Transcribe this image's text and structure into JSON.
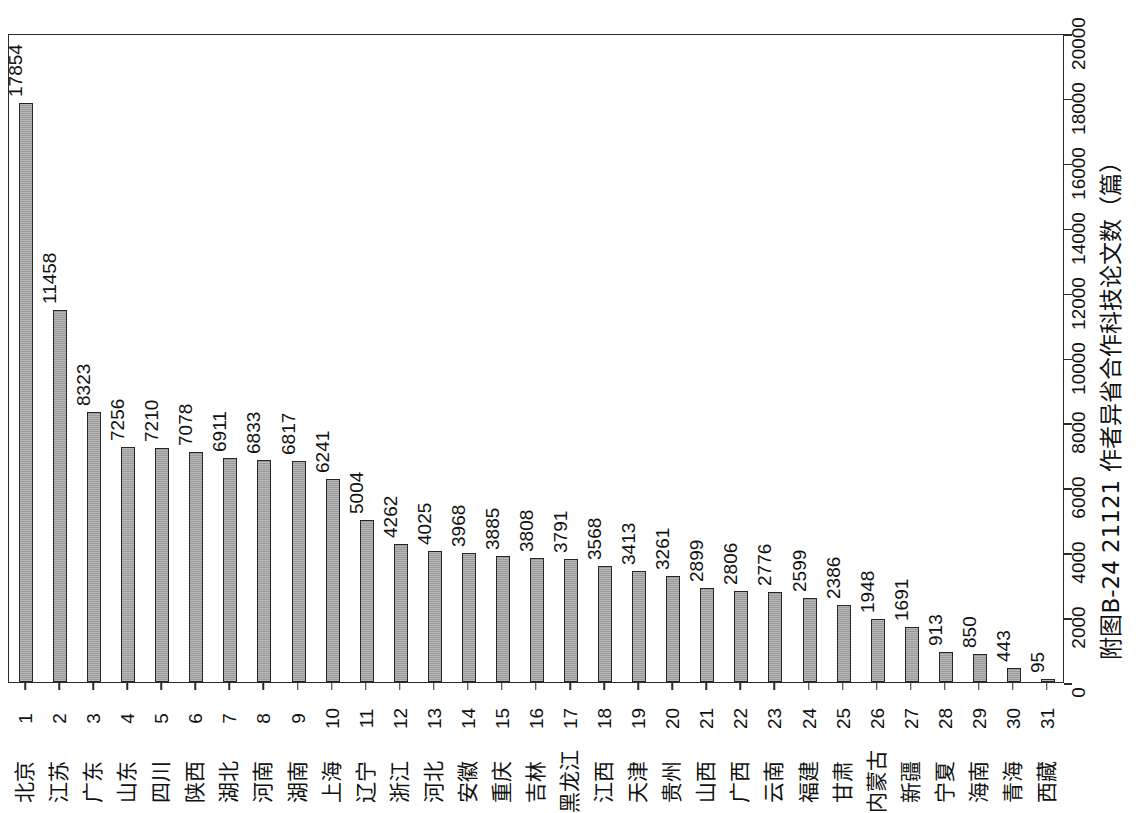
{
  "caption": "附图B-24  21121 作者异省合作科技论文数（篇）",
  "axis": {
    "value_ticks": [
      0,
      2000,
      4000,
      6000,
      8000,
      10000,
      12000,
      14000,
      16000,
      18000,
      20000
    ],
    "value_tick_labels": [
      "0",
      "2000",
      "4000",
      "6000",
      "8000",
      "10000",
      "12000",
      "14000",
      "16000",
      "18000",
      "20000"
    ],
    "value_min": 0,
    "value_max": 20000
  },
  "style": {
    "bar_fill": "#9a9a9a",
    "bar_border": "#262626",
    "frame_color": "#2b2b2b",
    "text_color": "#111111",
    "background": "#ffffff"
  },
  "chart_data": {
    "type": "bar",
    "title": "附图B-24  21121 作者异省合作科技论文数（篇）",
    "xlabel": "",
    "ylabel": "作者异省合作科技论文数（篇）",
    "orientation": "rotated-90",
    "grid": false,
    "legend": "none",
    "ylim": [
      0,
      20000
    ],
    "categories": [
      "北京",
      "江苏",
      "广东",
      "山东",
      "四川",
      "陕西",
      "湖北",
      "河南",
      "湖南",
      "上海",
      "辽宁",
      "浙江",
      "河北",
      "安徽",
      "重庆",
      "吉林",
      "黑龙江",
      "江西",
      "天津",
      "贵州",
      "山西",
      "广西",
      "云南",
      "福建",
      "甘肃",
      "内蒙古",
      "新疆",
      "宁夏",
      "海南",
      "青海",
      "西藏"
    ],
    "ranks": [
      "1",
      "2",
      "3",
      "4",
      "5",
      "6",
      "7",
      "8",
      "9",
      "10",
      "11",
      "12",
      "13",
      "14",
      "15",
      "16",
      "17",
      "18",
      "19",
      "20",
      "21",
      "22",
      "23",
      "24",
      "25",
      "26",
      "27",
      "28",
      "29",
      "30",
      "31"
    ],
    "values": [
      17854,
      11458,
      8323,
      7256,
      7210,
      7078,
      6911,
      6833,
      6817,
      6241,
      5004,
      4262,
      4025,
      3968,
      3885,
      3808,
      3791,
      3568,
      3413,
      3261,
      2899,
      2806,
      2776,
      2599,
      2386,
      1948,
      1691,
      913,
      850,
      443,
      95
    ],
    "value_labels": [
      "17854",
      "11458",
      "8323",
      "7256",
      "7210",
      "7078",
      "6911",
      "6833",
      "6817",
      "6241",
      "5004",
      "4262",
      "4025",
      "3968",
      "3885",
      "3808",
      "3791",
      "3568",
      "3413",
      "3261",
      "2899",
      "2806",
      "2776",
      "2599",
      "2386",
      "1948",
      "1691",
      "913",
      "850",
      "443",
      "95"
    ]
  }
}
